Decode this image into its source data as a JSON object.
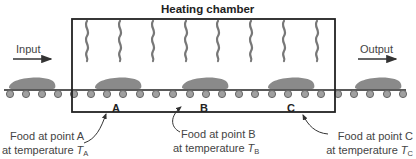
{
  "diagram": {
    "title": "Heating chamber",
    "input_label": "Input",
    "output_label": "Output",
    "colors": {
      "outline": "#222222",
      "food": "#8a8a8a",
      "roller_fill": "#9a9a9a",
      "roller_stroke": "#666666",
      "heat_wave": "#777777",
      "text": "#444444"
    },
    "points": [
      {
        "id": "A",
        "label": "A",
        "caption_line1": "Food at point A",
        "caption_line2": "at temperature ",
        "temp_symbol": "T",
        "temp_subscript": "A"
      },
      {
        "id": "B",
        "label": "B",
        "caption_line1": "Food at point B",
        "caption_line2": "at temperature ",
        "temp_symbol": "T",
        "temp_subscript": "B"
      },
      {
        "id": "C",
        "label": "C",
        "caption_line1": "Food at point C",
        "caption_line2": "at temperature ",
        "temp_symbol": "T",
        "temp_subscript": "C"
      }
    ],
    "heat_wave_count": 8,
    "food_item_count": 5,
    "roller_count": 19
  }
}
